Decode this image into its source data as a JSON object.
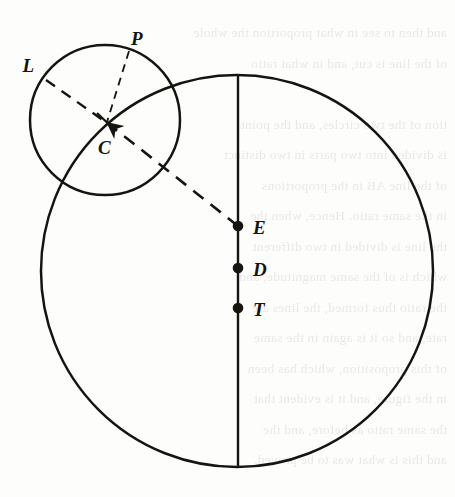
{
  "page": {
    "width": 455,
    "height": 497,
    "background_color": "#fdfdfc",
    "ink_color": "#16140f",
    "bleed_text_color": "#5d5a52",
    "kind": "scanned-book-figure"
  },
  "figure": {
    "name": "two-circles-geometry-diagram",
    "labels": [
      {
        "id": "L",
        "text": "L",
        "x": 34,
        "y": 72,
        "anchor": "end"
      },
      {
        "id": "P",
        "text": "P",
        "x": 131,
        "y": 45,
        "anchor": "start"
      },
      {
        "id": "C",
        "text": "C",
        "x": 98,
        "y": 154,
        "anchor": "start"
      },
      {
        "id": "E",
        "text": "E",
        "x": 253,
        "y": 234,
        "anchor": "start"
      },
      {
        "id": "D",
        "text": "D",
        "x": 253,
        "y": 276,
        "anchor": "start"
      },
      {
        "id": "T",
        "text": "T",
        "x": 253,
        "y": 316,
        "anchor": "start"
      }
    ],
    "circles": [
      {
        "id": "large-circle",
        "cx": 237,
        "cy": 271,
        "r": 196,
        "style": "solid"
      },
      {
        "id": "small-circle",
        "cx": 105,
        "cy": 120,
        "r": 75,
        "style": "solid"
      }
    ],
    "points": [
      {
        "id": "E",
        "x": 238,
        "y": 226,
        "r": 5.2
      },
      {
        "id": "D",
        "x": 238,
        "y": 268,
        "r": 5.2
      },
      {
        "id": "T",
        "x": 238,
        "y": 308,
        "r": 5.2
      }
    ],
    "lines": [
      {
        "id": "vertical-diameter",
        "x1": 238,
        "y1": 75,
        "x2": 238,
        "y2": 467,
        "style": "solid"
      },
      {
        "id": "chord-L-to-C",
        "x1": 46,
        "y1": 80,
        "x2": 106,
        "y2": 122,
        "style": "dashed"
      },
      {
        "id": "segment-P-to-C",
        "x1": 128,
        "y1": 52,
        "x2": 106,
        "y2": 122,
        "style": "dashed"
      },
      {
        "id": "ray-C-to-E",
        "x1": 106,
        "y1": 122,
        "x2": 238,
        "y2": 226,
        "style": "dashed",
        "arrow": "end"
      },
      {
        "id": "tick-at-C",
        "x1": 98,
        "y1": 114,
        "x2": 115,
        "y2": 130,
        "style": "solid"
      }
    ]
  },
  "bleed_text": {
    "note": "faint mirrored show-through text from the reverse page",
    "lines": [
      "and then to see in what proportion the whole",
      "of the line is cut, and in what ratio",
      "",
      "tion of the two circles, and the point",
      "is divided into two parts in two distinct",
      "of the line AB in the proportions",
      "in the same ratio. Hence, when the",
      "the line is divided in two different",
      "which is of the same magnitude, and",
      "the ratio thus formed, the lines are",
      "rate, and so it is again in the same",
      "of this proposition, which has been",
      "in the figure, and it is evident that",
      "the same ratio as before, and the",
      "and this is what was to be proved."
    ]
  }
}
